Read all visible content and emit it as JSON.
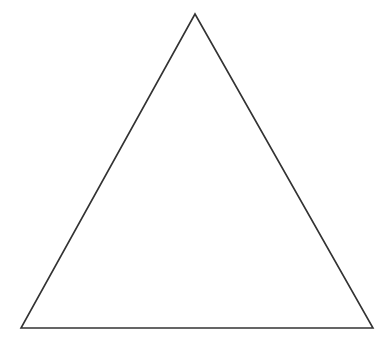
{
  "figure": {
    "shape": "triangle",
    "kind": "equilateral-outline",
    "stroke_color": "#333333",
    "fill_color": "none",
    "stroke_width": 1.6,
    "vertices": {
      "apex": [
        195,
        14
      ],
      "bottom_left": [
        21,
        328
      ],
      "bottom_right": [
        373,
        328
      ]
    }
  },
  "background_color": "#ffffff"
}
